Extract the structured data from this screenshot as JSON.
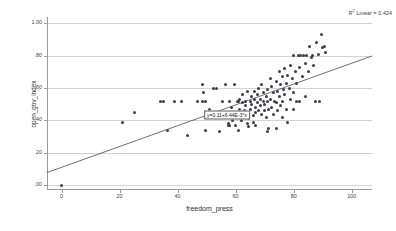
{
  "chart_data": {
    "type": "scatter",
    "title": "",
    "xlabel": "freedom_press",
    "ylabel": "open_gov_index",
    "xlim": [
      -5,
      107
    ],
    "ylim": [
      -0.03,
      1.04
    ],
    "xticks": [
      0,
      20,
      40,
      60,
      80,
      100
    ],
    "xticklabels": [
      "0",
      "20",
      "40",
      "60",
      "80",
      "100"
    ],
    "yticks": [
      0.0,
      0.2,
      0.4,
      0.6,
      0.8,
      1.0
    ],
    "yticklabels": [
      ".00",
      ".20",
      ".40",
      ".60",
      ".80",
      "1.00"
    ],
    "grid": "horizontal",
    "legend_position": "top-right",
    "r_squared_label": "R",
    "r_squared_sup": "2",
    "r_squared_text": " Linear = 0.424",
    "r_squared_value": 0.424,
    "fit": {
      "type": "linear",
      "equation_label": "y=0.11+6.44E-3*x",
      "intercept": 0.11,
      "slope": 0.00644,
      "label_x": 57,
      "label_y": 0.435
    },
    "series": [
      {
        "name": "countries",
        "marker": "filled-circle",
        "color": "#3d3d4a",
        "points": [
          [
            0.0,
            0.0
          ],
          [
            21.0,
            0.39
          ],
          [
            25.0,
            0.45
          ],
          [
            34.0,
            0.52
          ],
          [
            35.0,
            0.52
          ],
          [
            36.5,
            0.34
          ],
          [
            39.0,
            0.52
          ],
          [
            41.5,
            0.52
          ],
          [
            43.5,
            0.31
          ],
          [
            47.0,
            0.52
          ],
          [
            48.5,
            0.52
          ],
          [
            49.5,
            0.52
          ],
          [
            48.5,
            0.62
          ],
          [
            49.0,
            0.57
          ],
          [
            49.5,
            0.34
          ],
          [
            51.0,
            0.47
          ],
          [
            52.5,
            0.6
          ],
          [
            53.5,
            0.6
          ],
          [
            54.0,
            0.43
          ],
          [
            54.5,
            0.33
          ],
          [
            55.0,
            0.43
          ],
          [
            55.5,
            0.52
          ],
          [
            56.0,
            0.43
          ],
          [
            56.5,
            0.43
          ],
          [
            56.5,
            0.62
          ],
          [
            57.0,
            0.43
          ],
          [
            57.5,
            0.38
          ],
          [
            57.5,
            0.37
          ],
          [
            58.0,
            0.37
          ],
          [
            58.5,
            0.48
          ],
          [
            59.0,
            0.4
          ],
          [
            60.0,
            0.37
          ],
          [
            60.5,
            0.52
          ],
          [
            61.0,
            0.52
          ],
          [
            61.5,
            0.47
          ],
          [
            61.5,
            0.53
          ],
          [
            62.0,
            0.44
          ],
          [
            62.0,
            0.4
          ],
          [
            62.5,
            0.51
          ],
          [
            62.5,
            0.56
          ],
          [
            63.0,
            0.46
          ],
          [
            63.0,
            0.42
          ],
          [
            63.5,
            0.52
          ],
          [
            63.5,
            0.49
          ],
          [
            64.0,
            0.58
          ],
          [
            64.0,
            0.44
          ],
          [
            64.5,
            0.41
          ],
          [
            64.5,
            0.36
          ],
          [
            65.0,
            0.52
          ],
          [
            65.0,
            0.47
          ],
          [
            65.5,
            0.55
          ],
          [
            65.5,
            0.5
          ],
          [
            66.0,
            0.43
          ],
          [
            66.0,
            0.39
          ],
          [
            66.5,
            0.58
          ],
          [
            66.5,
            0.53
          ],
          [
            67.0,
            0.48
          ],
          [
            67.0,
            0.45
          ],
          [
            67.5,
            0.56
          ],
          [
            67.5,
            0.51
          ],
          [
            68.0,
            0.6
          ],
          [
            68.0,
            0.46
          ],
          [
            68.5,
            0.53
          ],
          [
            68.5,
            0.49
          ],
          [
            69.0,
            0.62
          ],
          [
            69.0,
            0.44
          ],
          [
            69.5,
            0.57
          ],
          [
            69.5,
            0.52
          ],
          [
            70.0,
            0.5
          ],
          [
            70.0,
            0.46
          ],
          [
            70.5,
            0.55
          ],
          [
            70.5,
            0.42
          ],
          [
            71.0,
            0.59
          ],
          [
            71.0,
            0.52
          ],
          [
            71.5,
            0.47
          ],
          [
            71.5,
            0.35
          ],
          [
            72.0,
            0.66
          ],
          [
            72.0,
            0.53
          ],
          [
            72.5,
            0.61
          ],
          [
            72.5,
            0.48
          ],
          [
            73.0,
            0.57
          ],
          [
            73.0,
            0.44
          ],
          [
            73.5,
            0.52
          ],
          [
            74.0,
            0.64
          ],
          [
            74.0,
            0.51
          ],
          [
            74.5,
            0.58
          ],
          [
            74.5,
            0.46
          ],
          [
            75.0,
            0.7
          ],
          [
            75.0,
            0.55
          ],
          [
            75.5,
            0.62
          ],
          [
            75.5,
            0.49
          ],
          [
            76.0,
            0.67
          ],
          [
            76.0,
            0.52
          ],
          [
            76.5,
            0.59
          ],
          [
            77.0,
            0.72
          ],
          [
            77.0,
            0.56
          ],
          [
            77.5,
            0.63
          ],
          [
            77.5,
            0.47
          ],
          [
            78.0,
            0.68
          ],
          [
            78.0,
            0.39
          ],
          [
            78.5,
            0.6
          ],
          [
            79.0,
            0.74
          ],
          [
            79.0,
            0.53
          ],
          [
            79.5,
            0.66
          ],
          [
            80.0,
            0.8
          ],
          [
            80.0,
            0.57
          ],
          [
            80.5,
            0.7
          ],
          [
            81.0,
            0.63
          ],
          [
            81.5,
            0.8
          ],
          [
            82.0,
            0.73
          ],
          [
            82.0,
            0.52
          ],
          [
            82.5,
            0.8
          ],
          [
            83.0,
            0.67
          ],
          [
            83.5,
            0.8
          ],
          [
            84.0,
            0.75
          ],
          [
            84.5,
            0.8
          ],
          [
            85.0,
            0.7
          ],
          [
            85.5,
            0.86
          ],
          [
            86.0,
            0.79
          ],
          [
            86.5,
            0.8
          ],
          [
            87.0,
            0.74
          ],
          [
            87.5,
            0.52
          ],
          [
            88.0,
            0.88
          ],
          [
            88.5,
            0.81
          ],
          [
            89.0,
            0.52
          ],
          [
            89.5,
            0.93
          ],
          [
            90.0,
            0.85
          ],
          [
            90.5,
            0.86
          ],
          [
            91.0,
            0.82
          ],
          [
            59.5,
            0.62
          ],
          [
            53.0,
            0.43
          ],
          [
            58.0,
            0.52
          ],
          [
            81.0,
            0.52
          ],
          [
            74.0,
            0.35
          ],
          [
            71.0,
            0.33
          ],
          [
            61.0,
            0.34
          ],
          [
            67.0,
            0.37
          ],
          [
            64.0,
            0.38
          ],
          [
            76.0,
            0.42
          ],
          [
            80.0,
            0.47
          ],
          [
            84.0,
            0.55
          ]
        ]
      }
    ]
  }
}
